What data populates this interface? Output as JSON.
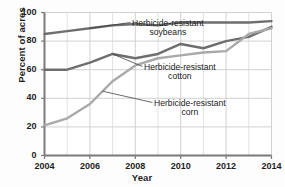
{
  "chart_data": {
    "type": "line",
    "title": "",
    "xlabel": "Year",
    "ylabel": "Percent of acres",
    "xlim": [
      2004,
      2014
    ],
    "ylim": [
      0,
      100
    ],
    "grid": true,
    "legend_position": "inline-annotations",
    "x": [
      2004,
      2005,
      2006,
      2007,
      2008,
      2009,
      2010,
      2011,
      2012,
      2013,
      2014
    ],
    "xticks": [
      "2004",
      "2006",
      "2008",
      "2010",
      "2012",
      "2014"
    ],
    "xtick_values": [
      2004,
      2006,
      2008,
      2010,
      2012,
      2014
    ],
    "yticks": [
      "0",
      "20",
      "40",
      "60",
      "80",
      "100"
    ],
    "ytick_values": [
      0,
      20,
      40,
      60,
      80,
      100
    ],
    "series": [
      {
        "name": "Herbicide-resistant soybeans",
        "color": "#6e6e6e",
        "values": [
          85,
          87,
          89,
          91,
          92,
          91,
          93,
          93,
          93,
          93,
          94
        ]
      },
      {
        "name": "Herbicide-resistant cotton",
        "color": "#6e6e6e",
        "values": [
          60,
          60,
          65,
          71,
          68,
          71,
          78,
          75,
          80,
          83,
          90
        ]
      },
      {
        "name": "Herbicide-resistant corn",
        "color": "#a9a9a9",
        "values": [
          21,
          26,
          36,
          52,
          63,
          68,
          70,
          72,
          73,
          85,
          89
        ]
      }
    ],
    "annotations": [
      {
        "id": "soybeans",
        "line1": "Herbicide-resistant",
        "line2": "soybeans",
        "target_x": 2006.0,
        "target_y": 89
      },
      {
        "id": "cotton",
        "line1": "Herbicide-resistant",
        "line2": "cotton",
        "target_x": 2007.0,
        "target_y": 71
      },
      {
        "id": "corn",
        "line1": "Herbicide-resistant",
        "line2": "corn",
        "target_x": 2006.55,
        "target_y": 45
      }
    ]
  }
}
